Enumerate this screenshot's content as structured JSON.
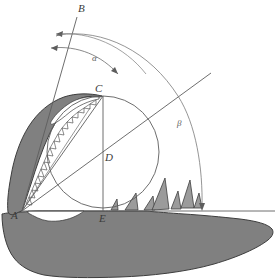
{
  "figure": {
    "canvas": {
      "width": 275,
      "height": 280
    },
    "colors": {
      "jaw_fill": "#808080",
      "jaw_stroke": "#3d3d3d",
      "tooth_fill": "#9b9b9b",
      "construction_line": "#6b6b6b",
      "arc_line": "#7a7a7a",
      "label_text": "#3a3a3a",
      "background": "#ffffff"
    },
    "points": [
      {
        "id": "A",
        "label": "A",
        "x": 22,
        "y": 211,
        "label_x": 12,
        "label_y": 210
      },
      {
        "id": "B",
        "label": "B",
        "x": 78,
        "y": 18,
        "label_x": 78,
        "label_y": 4
      },
      {
        "id": "C",
        "label": "C",
        "x": 103,
        "y": 96,
        "label_x": 96,
        "label_y": 84
      },
      {
        "id": "D",
        "label": "D",
        "x": 103,
        "y": 152,
        "label_x": 104,
        "label_y": 152
      },
      {
        "id": "E",
        "label": "E",
        "x": 103,
        "y": 208,
        "label_x": 99,
        "label_y": 212
      }
    ],
    "angles": [
      {
        "id": "alpha",
        "label": "α",
        "label_x": 92,
        "label_y": 54
      },
      {
        "id": "beta",
        "label": "β",
        "label_x": 177,
        "label_y": 119
      }
    ],
    "circle": {
      "cx": 103,
      "cy": 152,
      "r": 56
    },
    "baseline": {
      "x1": 22,
      "y1": 211,
      "x2": 275,
      "y2": 211
    }
  }
}
